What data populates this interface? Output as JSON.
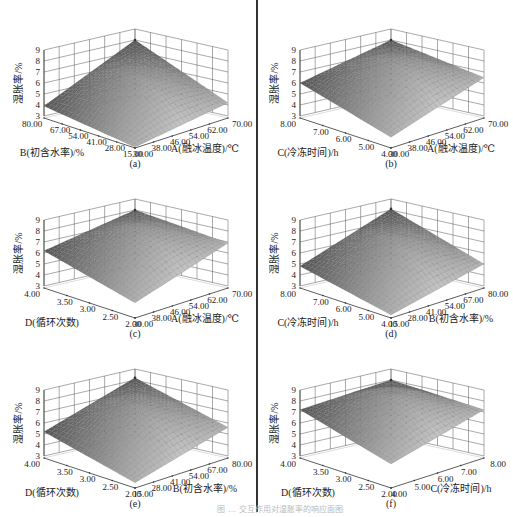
{
  "figure": {
    "caption": "图 … 交互作用对湿胀率的响应面图",
    "z_axis_label": "湿胀率/%",
    "z_ticks": [
      "3",
      "4",
      "5",
      "6",
      "7",
      "8",
      "9"
    ]
  },
  "panels": [
    {
      "id": "a",
      "label": "(a)",
      "left_axis": "B(初含水率)/%",
      "right_axis": "A(融冰温度)/℃",
      "left_ticks": [
        "80.00",
        "67.00",
        "54.00",
        "41.00",
        "28.00",
        "15.00"
      ],
      "right_ticks": [
        "30.00",
        "38.00",
        "46.00",
        "54.00",
        "62.00",
        "70.00"
      ]
    },
    {
      "id": "b",
      "label": "(b)",
      "left_axis": "C(冷冻时间)/h",
      "right_axis": "A(融冰温度)/℃",
      "left_ticks": [
        "8.00",
        "7.00",
        "6.00",
        "5.00",
        "4.00"
      ],
      "right_ticks": [
        "30.00",
        "38.00",
        "46.00",
        "54.00",
        "62.00",
        "70.00"
      ]
    },
    {
      "id": "c",
      "label": "(c)",
      "left_axis": "D(循环次数)",
      "right_axis": "A(融冰温度)/℃",
      "left_ticks": [
        "4.00",
        "3.50",
        "3.00",
        "2.50",
        "2.00"
      ],
      "right_ticks": [
        "30.00",
        "38.00",
        "46.00",
        "54.00",
        "62.00",
        "70.00"
      ]
    },
    {
      "id": "d",
      "label": "(d)",
      "left_axis": "C(冷冻时间)/h",
      "right_axis": "B(初含水率)/%",
      "left_ticks": [
        "8.00",
        "7.00",
        "6.00",
        "5.00",
        "4.00"
      ],
      "right_ticks": [
        "15.00",
        "28.00",
        "41.00",
        "54.00",
        "67.00",
        "80.00"
      ]
    },
    {
      "id": "e",
      "label": "(e)",
      "left_axis": "D(循环次数)",
      "right_axis": "B(初含水率)/%",
      "left_ticks": [
        "4.00",
        "3.50",
        "3.00",
        "2.50",
        "2.00"
      ],
      "right_ticks": [
        "15.00",
        "28.00",
        "41.00",
        "54.00",
        "67.00",
        "80.00"
      ]
    },
    {
      "id": "f",
      "label": "(f)",
      "left_axis": "D(循环次数)",
      "right_axis": "C(冷冻时间)/h",
      "left_ticks": [
        "4.00",
        "3.50",
        "3.00",
        "2.50",
        "2.00"
      ],
      "right_ticks": [
        "4.00",
        "5.00",
        "6.00",
        "7.00",
        "8.00"
      ]
    }
  ],
  "chart_data": [
    {
      "type": "surface",
      "title": "(a)",
      "xlabel": "B(初含水率)/%",
      "ylabel": "A(融冰温度)/℃",
      "zlabel": "湿胀率/%",
      "x_range": [
        15,
        80
      ],
      "y_range": [
        30,
        70
      ],
      "zlim": [
        3,
        9
      ],
      "corners": {
        "back_left": 3.9,
        "back": 8.0,
        "right": 4.2,
        "front": 2.9
      },
      "peak": 8.0
    },
    {
      "type": "surface",
      "title": "(b)",
      "xlabel": "C(冷冻时间)/h",
      "ylabel": "A(融冰温度)/℃",
      "zlabel": "湿胀率/%",
      "x_range": [
        4,
        8
      ],
      "y_range": [
        30,
        70
      ],
      "zlim": [
        3,
        9
      ],
      "corners": {
        "back_left": 6.0,
        "back": 8.0,
        "right": 6.5,
        "front": 3.8
      },
      "peak": 8.0
    },
    {
      "type": "surface",
      "title": "(c)",
      "xlabel": "D(循环次数)",
      "ylabel": "A(融冰温度)/℃",
      "zlabel": "湿胀率/%",
      "x_range": [
        2,
        4
      ],
      "y_range": [
        30,
        70
      ],
      "zlim": [
        3,
        9
      ],
      "corners": {
        "back_left": 6.2,
        "back": 8.0,
        "right": 6.9,
        "front": 4.2
      },
      "peak": 8.0
    },
    {
      "type": "surface",
      "title": "(d)",
      "xlabel": "C(冷冻时间)/h",
      "ylabel": "B(初含水率)/%",
      "zlabel": "湿胀率/%",
      "x_range": [
        4,
        8
      ],
      "y_range": [
        15,
        80
      ],
      "zlim": [
        3,
        9
      ],
      "corners": {
        "back_left": 4.8,
        "back": 8.1,
        "right": 5.0,
        "front": 3.1
      },
      "peak": 8.1
    },
    {
      "type": "surface",
      "title": "(e)",
      "xlabel": "D(循环次数)",
      "ylabel": "B(初含水率)/%",
      "zlabel": "湿胀率/%",
      "x_range": [
        2,
        4
      ],
      "y_range": [
        15,
        80
      ],
      "zlim": [
        3,
        9
      ],
      "corners": {
        "back_left": 5.2,
        "back": 8.2,
        "right": 5.6,
        "front": 3.3
      },
      "peak": 8.2
    },
    {
      "type": "surface",
      "title": "(f)",
      "xlabel": "D(循环次数)",
      "ylabel": "C(冷冻时间)/h",
      "zlabel": "湿胀率/%",
      "x_range": [
        2,
        4
      ],
      "y_range": [
        4,
        8
      ],
      "zlim": [
        3,
        9
      ],
      "corners": {
        "back_left": 7.2,
        "back": 8.0,
        "right": 7.2,
        "front": 5.0
      },
      "peak": 8.0
    }
  ]
}
